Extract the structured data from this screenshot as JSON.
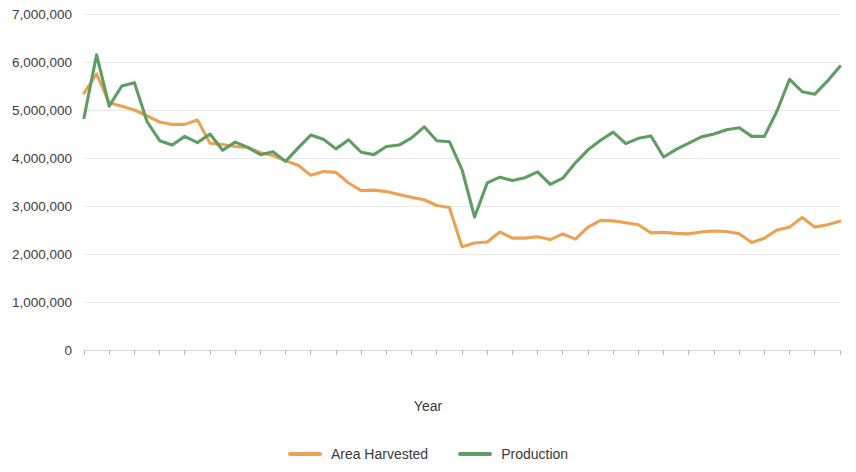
{
  "chart_data": {
    "type": "line",
    "title": "",
    "xlabel": "Year",
    "ylabel": "",
    "ylim": [
      0,
      7000000
    ],
    "yticks": [
      0,
      1000000,
      2000000,
      3000000,
      4000000,
      5000000,
      6000000,
      7000000
    ],
    "ytick_labels": [
      "0",
      "1,000,000",
      "2,000,000",
      "3,000,000",
      "4,000,000",
      "5,000,000",
      "6,000,000",
      "7,000,000"
    ],
    "grid": true,
    "legend_position": "bottom",
    "x": [
      1961,
      1962,
      1963,
      1964,
      1965,
      1966,
      1967,
      1968,
      1969,
      1970,
      1971,
      1972,
      1973,
      1974,
      1975,
      1976,
      1977,
      1978,
      1979,
      1980,
      1981,
      1982,
      1983,
      1984,
      1985,
      1986,
      1987,
      1988,
      1989,
      1990,
      1991,
      1992,
      1993,
      1994,
      1995,
      1996,
      1997,
      1998,
      1999,
      2000,
      2001,
      2002,
      2003,
      2004,
      2005,
      2006,
      2007,
      2008,
      2009,
      2010,
      2011,
      2012,
      2013,
      2014,
      2015,
      2016,
      2017,
      2018,
      2019,
      2020,
      2021
    ],
    "xtick_labels": [
      "1961",
      "1963",
      "1965",
      "1967",
      "1969",
      "1971",
      "1973",
      "1975",
      "1977",
      "1979",
      "1981",
      "1983",
      "1985",
      "1987",
      "1989",
      "1991",
      "1993",
      "1995",
      "1997",
      "1999",
      "2001",
      "2003",
      "2005",
      "2007",
      "2009",
      "2011",
      "2013",
      "2015",
      "2017",
      "2019",
      "2021"
    ],
    "series": [
      {
        "name": "Area Harvested",
        "color": "#EDA154",
        "values": [
          5350000,
          5750000,
          5150000,
          5080000,
          5000000,
          4880000,
          4750000,
          4700000,
          4700000,
          4790000,
          4310000,
          4280000,
          4240000,
          4220000,
          4110000,
          4050000,
          3940000,
          3850000,
          3640000,
          3720000,
          3700000,
          3480000,
          3320000,
          3330000,
          3300000,
          3240000,
          3180000,
          3130000,
          3010000,
          2970000,
          2150000,
          2230000,
          2250000,
          2460000,
          2330000,
          2330000,
          2360000,
          2300000,
          2420000,
          2310000,
          2560000,
          2700000,
          2690000,
          2650000,
          2610000,
          2440000,
          2450000,
          2430000,
          2420000,
          2460000,
          2480000,
          2470000,
          2420000,
          2240000,
          2330000,
          2500000,
          2560000,
          2760000,
          2560000,
          2610000,
          2680000
        ]
      },
      {
        "name": "Production",
        "color": "#5E9E63",
        "values": [
          4840000,
          6150000,
          5080000,
          5500000,
          5570000,
          4760000,
          4360000,
          4270000,
          4450000,
          4320000,
          4500000,
          4160000,
          4330000,
          4220000,
          4070000,
          4130000,
          3930000,
          4210000,
          4480000,
          4390000,
          4190000,
          4380000,
          4120000,
          4070000,
          4240000,
          4270000,
          4420000,
          4650000,
          4360000,
          4340000,
          3760000,
          2770000,
          3480000,
          3600000,
          3530000,
          3590000,
          3710000,
          3450000,
          3580000,
          3900000,
          4170000,
          4370000,
          4540000,
          4300000,
          4410000,
          4460000,
          4020000,
          4180000,
          4310000,
          4440000,
          4500000,
          4590000,
          4630000,
          4450000,
          4450000,
          4980000,
          5640000,
          5380000,
          5330000,
          5600000,
          5910000
        ]
      }
    ]
  },
  "axis": {
    "x_title": "Year"
  },
  "legend": {
    "items": [
      {
        "label": "Area Harvested",
        "color": "#EDA154",
        "icon": "line-swatch"
      },
      {
        "label": "Production",
        "color": "#5E9E63",
        "icon": "line-swatch"
      }
    ]
  }
}
